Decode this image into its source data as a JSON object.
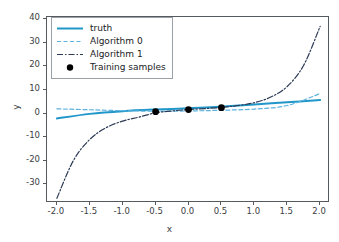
{
  "chart_data": {
    "type": "line",
    "title": "",
    "xlabel": "x",
    "ylabel": "y",
    "xlim": [
      -2.15,
      2.15
    ],
    "ylim": [
      -38,
      41
    ],
    "grid": false,
    "legend_position": "upper left",
    "xticks": [
      "-2.0",
      "-1.5",
      "-1.0",
      "-0.5",
      "0.0",
      "0.5",
      "1.0",
      "1.5",
      "2.0"
    ],
    "xtick_values": [
      -2.0,
      -1.5,
      -1.0,
      -0.5,
      0.0,
      0.5,
      1.0,
      1.5,
      2.0
    ],
    "yticks": [
      "40",
      "30",
      "20",
      "10",
      "0",
      "-10",
      "-20",
      "-30"
    ],
    "ytick_values": [
      40,
      30,
      20,
      10,
      0,
      -10,
      -20,
      -30
    ],
    "series": [
      {
        "name": "truth",
        "style": "solid",
        "color": "#2196c9",
        "x": [
          -2.0,
          -1.5,
          -1.0,
          -0.5,
          0.0,
          0.5,
          1.0,
          1.5,
          2.0
        ],
        "values": [
          -2.1,
          -0.15,
          1.0,
          1.7,
          2.2,
          2.9,
          3.8,
          4.8,
          5.7
        ]
      },
      {
        "name": "Algorithm 0",
        "style": "dashed",
        "color": "#5cb3e0",
        "x": [
          -2.0,
          -1.5,
          -1.0,
          -0.5,
          0.0,
          0.5,
          1.0,
          1.5,
          2.0
        ],
        "values": [
          2.0,
          1.6,
          1.2,
          1.0,
          1.1,
          1.4,
          1.9,
          3.4,
          8.5
        ]
      },
      {
        "name": "Algorithm 1",
        "style": "dashdot",
        "color": "#2b3a55",
        "x": [
          -2.0,
          -1.75,
          -1.5,
          -1.25,
          -1.0,
          -0.75,
          -0.5,
          -0.25,
          0.0,
          0.25,
          0.5,
          0.75,
          1.0,
          1.25,
          1.5,
          1.75,
          2.0
        ],
        "values": [
          -36.0,
          -20.0,
          -11.0,
          -6.0,
          -3.2,
          -1.5,
          0.3,
          1.1,
          1.7,
          2.1,
          2.6,
          3.4,
          4.6,
          7.0,
          11.5,
          20.5,
          37.0
        ]
      }
    ],
    "scatter": {
      "name": "Training samples",
      "color": "#000000",
      "marker": "circle",
      "x": [
        -0.5,
        0.0,
        0.5
      ],
      "values": [
        0.8,
        1.7,
        2.5
      ]
    },
    "legend_entries": [
      {
        "label": "truth",
        "style": "solid",
        "color": "#2196c9"
      },
      {
        "label": "Algorithm 0",
        "style": "dashed",
        "color": "#5cb3e0"
      },
      {
        "label": "Algorithm 1",
        "style": "dashdot",
        "color": "#2b3a55"
      },
      {
        "label": "Training samples",
        "style": "marker",
        "color": "#000000"
      }
    ]
  }
}
